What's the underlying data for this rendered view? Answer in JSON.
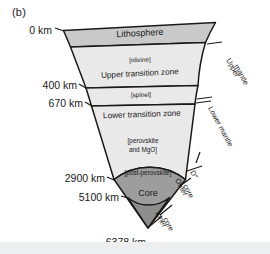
{
  "figure": {
    "panel_label": "(b)",
    "type": "earth-interior-wedge-diagram"
  },
  "colors": {
    "lithosphere_fill": "#c9c9c9",
    "mantle_fill": "#e9e9e9",
    "core_fill": "#9d9d9d",
    "inner_core_fill": "#8e8e8e",
    "stroke": "#1a1a1a",
    "bottom_band": "#eceef0"
  },
  "depth_labels": [
    {
      "id": "surface",
      "text": "0 km"
    },
    {
      "id": "d400",
      "text": "400 km"
    },
    {
      "id": "d670",
      "text": "670 km"
    },
    {
      "id": "cmb",
      "text": "2900 km"
    },
    {
      "id": "icb",
      "text": "5100 km"
    },
    {
      "id": "center",
      "text": "6378 km"
    }
  ],
  "layers": [
    {
      "id": "lithosphere",
      "label": "Lithosphere"
    },
    {
      "id": "upper-transition-zone",
      "label": "Upper transition zone"
    },
    {
      "id": "lower-transition-zone",
      "label": "Lower transition zone"
    },
    {
      "id": "core",
      "label": "Core"
    }
  ],
  "mineral_labels": [
    {
      "id": "olivine",
      "text": "[olivine]"
    },
    {
      "id": "spinel",
      "text": "[spinel]"
    },
    {
      "id": "perovskite-1",
      "text": "[perovskite"
    },
    {
      "id": "perovskite-2",
      "text": "and MgO]"
    },
    {
      "id": "post-perovskite",
      "text": "[post-perovskite]"
    }
  ],
  "side_labels": [
    {
      "id": "upper-mantle-1",
      "text": "Upper"
    },
    {
      "id": "upper-mantle-2",
      "text": "mantle"
    },
    {
      "id": "lower-mantle",
      "text": "Lower mantle"
    },
    {
      "id": "d-double-prime",
      "text": "D″"
    },
    {
      "id": "outer-core-1",
      "text": "Outer"
    },
    {
      "id": "outer-core-2",
      "text": "core"
    },
    {
      "id": "inner-core-1",
      "text": "Inner"
    },
    {
      "id": "inner-core-2",
      "text": "core"
    }
  ]
}
